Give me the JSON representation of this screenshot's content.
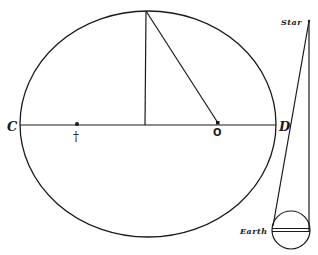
{
  "diagram": {
    "labels": {
      "left_vertex": "C",
      "right_vertex": "D",
      "center_point": "O",
      "focus_mark": "†",
      "star": "Star",
      "earth": "Earth"
    },
    "colors": {
      "ink": "#1a1a1a",
      "background": "#ffffff"
    }
  }
}
